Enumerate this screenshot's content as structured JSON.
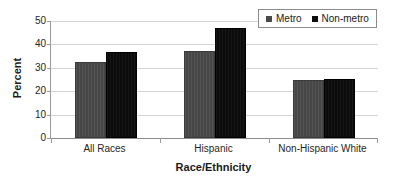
{
  "chart_data": {
    "type": "bar",
    "title": "",
    "xlabel": "Race/Ethnicity",
    "ylabel": "Percent",
    "ylim": [
      0,
      50
    ],
    "yticks": [
      0,
      10,
      20,
      30,
      40,
      50
    ],
    "ytick_labels": [
      "0",
      "10",
      "20",
      "30",
      "40",
      "50"
    ],
    "grid": true,
    "legend_position": "top-right",
    "categories": [
      "All Races",
      "Hispanic",
      "Non-Hispanic White"
    ],
    "series": [
      {
        "name": "Metro",
        "color": "#4a4a4a",
        "values": [
          32.3,
          37.0,
          24.8
        ]
      },
      {
        "name": "Non-metro",
        "color": "#0d0d0d",
        "values": [
          36.6,
          47.0,
          25.4
        ]
      }
    ]
  },
  "legend": {
    "entries": [
      {
        "label": "Metro",
        "swatch": "metro-swatch"
      },
      {
        "label": "Non-metro",
        "swatch": "nonmetro-swatch"
      }
    ]
  }
}
